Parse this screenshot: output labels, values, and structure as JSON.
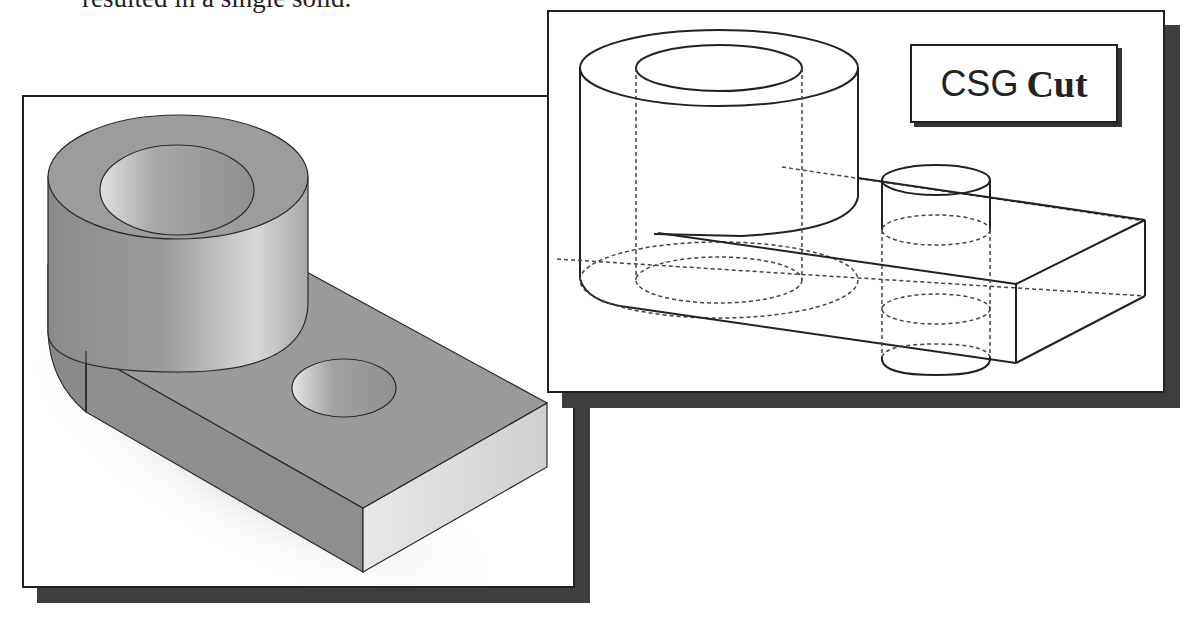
{
  "caption": {
    "text": "resulted in a single solid."
  },
  "figures": {
    "left": {
      "description": "Shaded isometric solid: hollow cylinder joined with rectangular plate containing a through hole",
      "colors": {
        "face_top": "#9a9a9a",
        "face_side": "#8c8c8c",
        "face_light": "#dcdcdc",
        "edge": "#2a2a2a",
        "shadow": "#3e3e3e"
      }
    },
    "right": {
      "description": "Wireframe CSG construction: large hollow cylinder, rectangular block and small cylinder with hidden (dashed) edges",
      "label": {
        "part1": "CSG",
        "part2": "Cut"
      },
      "colors": {
        "edge": "#222222",
        "hidden_edge": "#444444"
      }
    }
  }
}
